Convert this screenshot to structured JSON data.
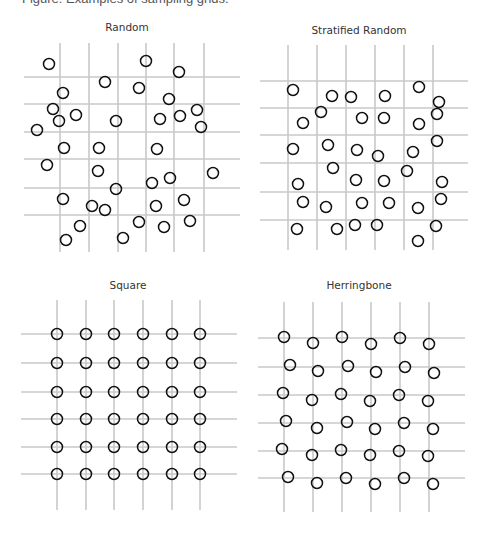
{
  "caption": "Figure: Examples of sampling grids.",
  "colors": {
    "grid": "#c8c8c8",
    "point": "#111111",
    "title": "#333333"
  },
  "panels": [
    {
      "title": "Random",
      "title_pos": [
        127,
        31
      ],
      "vlines": {
        "x": [
          60,
          89,
          118,
          146,
          174,
          204
        ],
        "y1": 43,
        "y2": 252
      },
      "hlines": {
        "y": [
          77,
          104,
          132,
          159,
          188,
          215
        ],
        "x1": 24,
        "x2": 240
      },
      "points": [
        [
          49,
          64
        ],
        [
          146,
          61
        ],
        [
          179,
          72
        ],
        [
          105,
          82
        ],
        [
          139,
          88
        ],
        [
          63,
          93
        ],
        [
          169,
          99
        ],
        [
          53,
          109
        ],
        [
          197,
          110
        ],
        [
          76,
          115
        ],
        [
          59,
          121
        ],
        [
          116,
          121
        ],
        [
          160,
          119
        ],
        [
          180,
          116
        ],
        [
          201,
          127
        ],
        [
          37,
          130
        ],
        [
          64,
          148
        ],
        [
          99,
          148
        ],
        [
          157,
          149
        ],
        [
          47,
          165
        ],
        [
          98,
          171
        ],
        [
          213,
          173
        ],
        [
          116,
          189
        ],
        [
          152,
          183
        ],
        [
          170,
          178
        ],
        [
          63,
          199
        ],
        [
          92,
          206
        ],
        [
          105,
          210
        ],
        [
          156,
          206
        ],
        [
          184,
          200
        ],
        [
          80,
          226
        ],
        [
          139,
          222
        ],
        [
          164,
          227
        ],
        [
          190,
          221
        ],
        [
          66,
          240
        ],
        [
          123,
          238
        ]
      ]
    },
    {
      "title": "Stratified Random",
      "title_pos": [
        359,
        34
      ],
      "vlines": {
        "x": [
          288,
          317,
          346,
          375,
          404,
          433
        ],
        "y1": 45,
        "y2": 250
      },
      "hlines": {
        "y": [
          81,
          108,
          135,
          163,
          192,
          220
        ],
        "x1": 260,
        "x2": 468
      },
      "points": [
        [
          293,
          90
        ],
        [
          332,
          96
        ],
        [
          351,
          97
        ],
        [
          385,
          96
        ],
        [
          419,
          87
        ],
        [
          439,
          102
        ],
        [
          321,
          112
        ],
        [
          437,
          114
        ],
        [
          303,
          123
        ],
        [
          362,
          118
        ],
        [
          384,
          118
        ],
        [
          419,
          124
        ],
        [
          437,
          141
        ],
        [
          293,
          149
        ],
        [
          328,
          145
        ],
        [
          357,
          150
        ],
        [
          378,
          156
        ],
        [
          413,
          152
        ],
        [
          333,
          168
        ],
        [
          407,
          171
        ],
        [
          298,
          184
        ],
        [
          356,
          180
        ],
        [
          384,
          181
        ],
        [
          442,
          182
        ],
        [
          303,
          202
        ],
        [
          326,
          207
        ],
        [
          362,
          203
        ],
        [
          389,
          203
        ],
        [
          418,
          208
        ],
        [
          441,
          199
        ],
        [
          297,
          229
        ],
        [
          337,
          229
        ],
        [
          355,
          225
        ],
        [
          377,
          225
        ],
        [
          436,
          226
        ],
        [
          418,
          241
        ]
      ]
    },
    {
      "title": "Square",
      "title_pos": [
        128,
        289
      ],
      "vlines": {
        "x": [
          57,
          86,
          114,
          143,
          172,
          200
        ],
        "y1": 300,
        "y2": 510
      },
      "hlines": {
        "y": [
          334,
          363,
          392,
          419,
          447,
          474
        ],
        "x1": 21,
        "x2": 237
      },
      "points_grid": {
        "x": [
          57,
          86,
          114,
          143,
          172,
          200
        ],
        "y": [
          334,
          363,
          392,
          419,
          447,
          474
        ]
      }
    },
    {
      "title": "Herringbone",
      "title_pos": [
        359,
        289
      ],
      "vlines": {
        "x": [
          284,
          313,
          342,
          371,
          400,
          429
        ],
        "y1": 302,
        "y2": 512
      },
      "hlines": {
        "y": [
          338,
          367,
          395,
          423,
          451,
          478
        ],
        "x1": 258,
        "x2": 465
      },
      "points": [
        [
          284,
          337
        ],
        [
          313,
          343
        ],
        [
          342,
          337
        ],
        [
          371,
          344
        ],
        [
          400,
          338
        ],
        [
          429,
          344
        ],
        [
          290,
          365
        ],
        [
          318,
          371
        ],
        [
          348,
          366
        ],
        [
          376,
          372
        ],
        [
          405,
          367
        ],
        [
          434,
          373
        ],
        [
          283,
          393
        ],
        [
          312,
          400
        ],
        [
          341,
          394
        ],
        [
          370,
          401
        ],
        [
          399,
          395
        ],
        [
          428,
          401
        ],
        [
          286,
          421
        ],
        [
          317,
          428
        ],
        [
          347,
          422
        ],
        [
          375,
          429
        ],
        [
          404,
          423
        ],
        [
          433,
          429
        ],
        [
          282,
          449
        ],
        [
          312,
          455
        ],
        [
          341,
          450
        ],
        [
          370,
          455
        ],
        [
          399,
          451
        ],
        [
          428,
          456
        ],
        [
          288,
          477
        ],
        [
          317,
          483
        ],
        [
          346,
          478
        ],
        [
          375,
          484
        ],
        [
          404,
          478
        ],
        [
          433,
          484
        ]
      ]
    }
  ]
}
